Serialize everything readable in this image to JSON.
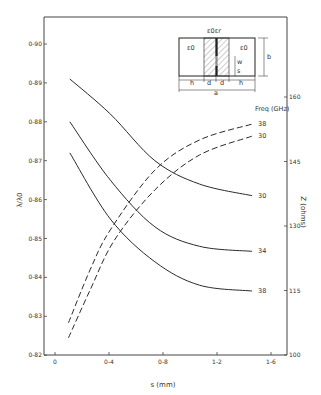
{
  "chart_data": {
    "type": "line",
    "title": "",
    "xlabel": "s (mm)",
    "ylabel": "λ/λ0",
    "y2label": "Z (ohms)",
    "xlim": [
      -0.0815,
      1.7
    ],
    "ylim": [
      0.82,
      0.9043
    ],
    "y2lim": [
      100,
      164.6
    ],
    "grid": false,
    "x_ticks": [
      0,
      0.4,
      0.8,
      1.2,
      1.6
    ],
    "x_tick_labels": [
      "0",
      "0-4",
      "0-8",
      "1-2",
      "1-6"
    ],
    "y_ticks": [
      0.82,
      0.83,
      0.84,
      0.85,
      0.86,
      0.87,
      0.88,
      0.89,
      0.9
    ],
    "y_tick_labels": [
      "0-82",
      "0-83",
      "0-84",
      "0-85",
      "0-86",
      "0-87",
      "0-88",
      "0-89",
      "0-90"
    ],
    "y2_ticks": [
      100,
      115,
      130,
      145,
      160
    ],
    "y2_tick_labels": [
      "100",
      "115",
      "130",
      "145",
      "160"
    ],
    "legend_title": "Freq (GHz)",
    "series": [
      {
        "name": "30",
        "axis": "left",
        "style": "solid",
        "x": [
          0.11,
          0.41,
          0.74,
          1.07,
          1.46
        ],
        "y": [
          0.891,
          0.882,
          0.87,
          0.864,
          0.861
        ]
      },
      {
        "name": "34",
        "axis": "left",
        "style": "solid",
        "x": [
          0.11,
          0.41,
          0.74,
          1.07,
          1.46
        ],
        "y": [
          0.88,
          0.865,
          0.853,
          0.848,
          0.8467
        ]
      },
      {
        "name": "38",
        "axis": "left",
        "style": "solid",
        "x": [
          0.11,
          0.41,
          0.74,
          1.07,
          1.46
        ],
        "y": [
          0.872,
          0.855,
          0.844,
          0.838,
          0.8365
        ]
      },
      {
        "name": "38",
        "axis": "right",
        "style": "dashed",
        "x": [
          0.1,
          0.26,
          0.41,
          0.74,
          1.07,
          1.46
        ],
        "y": [
          107.5,
          119.8,
          129.1,
          143.0,
          150.0,
          153.7
        ]
      },
      {
        "name": "30",
        "axis": "right",
        "style": "dashed",
        "x": [
          0.1,
          0.26,
          0.44,
          0.74,
          1.07,
          1.46
        ],
        "y": [
          104.0,
          115.1,
          126.7,
          138.4,
          146.5,
          150.9
        ]
      }
    ],
    "inset": {
      "description": "Cross-section of finline structure",
      "labels": [
        "ε0εr",
        "ε0",
        "ε0",
        "b",
        "w",
        "s",
        "h",
        "d",
        "d",
        "h",
        "a"
      ]
    }
  }
}
